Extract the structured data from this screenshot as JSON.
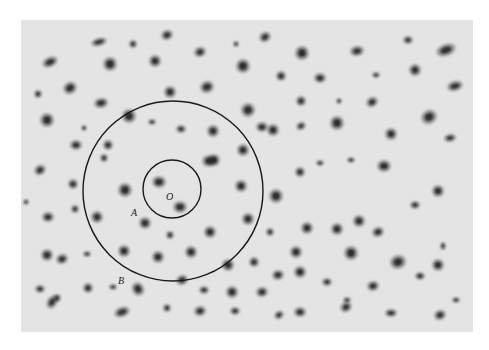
{
  "figure": {
    "background_color": "#e4e4e4",
    "line_color": "#1a1a1a",
    "galaxy_color": "#1c1c1c",
    "labels": [
      {
        "id": "O",
        "text": "O",
        "x": 166,
        "y": 192
      },
      {
        "id": "A",
        "text": "A",
        "x": 131,
        "y": 208
      },
      {
        "id": "B",
        "text": "B",
        "x": 118,
        "y": 276
      }
    ],
    "circles": [
      {
        "name": "inner-circle",
        "cx": 172,
        "cy": 189,
        "r": 29
      },
      {
        "name": "outer-circle",
        "cx": 173,
        "cy": 191,
        "r": 90
      }
    ],
    "galaxies": [
      [
        50,
        62,
        7,
        4,
        -25
      ],
      [
        99,
        42,
        7,
        3,
        -15
      ],
      [
        133,
        44,
        3,
        3,
        0
      ],
      [
        167,
        35,
        5,
        4,
        -20
      ],
      [
        200,
        52,
        5,
        4,
        -20
      ],
      [
        236,
        44,
        2,
        2,
        0
      ],
      [
        265,
        37,
        5,
        4,
        -30
      ],
      [
        302,
        53,
        6,
        6,
        0
      ],
      [
        357,
        51,
        6,
        4,
        -10
      ],
      [
        408,
        40,
        4,
        3,
        0
      ],
      [
        446,
        50,
        9,
        5,
        -20
      ],
      [
        110,
        64,
        6,
        6,
        0
      ],
      [
        155,
        61,
        5,
        5,
        0
      ],
      [
        170,
        92,
        5,
        5,
        0
      ],
      [
        207,
        87,
        5,
        6,
        70
      ],
      [
        243,
        66,
        6,
        6,
        0
      ],
      [
        281,
        76,
        4,
        4,
        0
      ],
      [
        320,
        78,
        5,
        4,
        0
      ],
      [
        376,
        75,
        3,
        2,
        0
      ],
      [
        415,
        70,
        5,
        5,
        60
      ],
      [
        455,
        86,
        7,
        4,
        -15
      ],
      [
        38,
        94,
        3,
        3,
        0
      ],
      [
        70,
        88,
        5,
        6,
        60
      ],
      [
        101,
        103,
        4,
        6,
        80
      ],
      [
        129,
        116,
        6,
        6,
        0
      ],
      [
        152,
        122,
        3,
        2,
        0
      ],
      [
        181,
        129,
        4,
        3,
        0
      ],
      [
        213,
        131,
        5,
        5,
        0
      ],
      [
        248,
        110,
        6,
        6,
        60
      ],
      [
        262,
        127,
        5,
        4,
        0
      ],
      [
        301,
        101,
        4,
        4,
        0
      ],
      [
        339,
        101,
        2,
        2,
        0
      ],
      [
        372,
        102,
        5,
        4,
        -30
      ],
      [
        429,
        117,
        6,
        7,
        60
      ],
      [
        47,
        120,
        6,
        6,
        0
      ],
      [
        84,
        128,
        2,
        2,
        0
      ],
      [
        76,
        145,
        5,
        4,
        0
      ],
      [
        108,
        145,
        4,
        4,
        0
      ],
      [
        214,
        160,
        5,
        5,
        0
      ],
      [
        243,
        150,
        5,
        5,
        0
      ],
      [
        273,
        130,
        5,
        5,
        0
      ],
      [
        301,
        126,
        4,
        3,
        -30
      ],
      [
        337,
        123,
        6,
        6,
        0
      ],
      [
        391,
        134,
        5,
        5,
        0
      ],
      [
        450,
        138,
        3,
        5,
        80
      ],
      [
        40,
        170,
        5,
        4,
        -30
      ],
      [
        73,
        184,
        4,
        4,
        0
      ],
      [
        104,
        158,
        3,
        3,
        0
      ],
      [
        125,
        190,
        6,
        6,
        0
      ],
      [
        159,
        182,
        6,
        5,
        0
      ],
      [
        180,
        207,
        6,
        5,
        0
      ],
      [
        209,
        161,
        6,
        5,
        0
      ],
      [
        241,
        186,
        5,
        5,
        0
      ],
      [
        276,
        196,
        6,
        6,
        0
      ],
      [
        300,
        172,
        4,
        4,
        0
      ],
      [
        320,
        163,
        3,
        2,
        0
      ],
      [
        351,
        160,
        3,
        2,
        0
      ],
      [
        384,
        166,
        6,
        5,
        0
      ],
      [
        438,
        191,
        5,
        5,
        0
      ],
      [
        26,
        202,
        2,
        2,
        0
      ],
      [
        48,
        217,
        5,
        4,
        0
      ],
      [
        75,
        209,
        3,
        3,
        0
      ],
      [
        97,
        217,
        5,
        5,
        60
      ],
      [
        145,
        223,
        5,
        5,
        0
      ],
      [
        170,
        235,
        3,
        3,
        0
      ],
      [
        210,
        232,
        5,
        5,
        0
      ],
      [
        248,
        219,
        5,
        5,
        0
      ],
      [
        270,
        232,
        3,
        3,
        0
      ],
      [
        307,
        228,
        5,
        5,
        0
      ],
      [
        337,
        229,
        5,
        5,
        0
      ],
      [
        359,
        221,
        5,
        5,
        0
      ],
      [
        378,
        232,
        4,
        5,
        70
      ],
      [
        415,
        205,
        4,
        3,
        0
      ],
      [
        443,
        246,
        2,
        3,
        0
      ],
      [
        47,
        255,
        5,
        5,
        0
      ],
      [
        62,
        259,
        5,
        4,
        -20
      ],
      [
        87,
        254,
        3,
        2,
        0
      ],
      [
        124,
        251,
        5,
        5,
        0
      ],
      [
        158,
        257,
        5,
        5,
        0
      ],
      [
        191,
        252,
        5,
        5,
        0
      ],
      [
        228,
        265,
        5,
        5,
        0
      ],
      [
        254,
        262,
        4,
        4,
        0
      ],
      [
        278,
        275,
        4,
        5,
        80
      ],
      [
        296,
        252,
        5,
        5,
        0
      ],
      [
        351,
        253,
        6,
        6,
        0
      ],
      [
        398,
        262,
        6,
        7,
        70
      ],
      [
        438,
        265,
        5,
        5,
        0
      ],
      [
        40,
        289,
        4,
        3,
        0
      ],
      [
        57,
        298,
        3,
        3,
        0
      ],
      [
        88,
        288,
        4,
        4,
        0
      ],
      [
        113,
        287,
        3,
        2,
        0
      ],
      [
        138,
        289,
        6,
        5,
        60
      ],
      [
        182,
        280,
        4,
        5,
        70
      ],
      [
        204,
        290,
        4,
        3,
        0
      ],
      [
        232,
        292,
        5,
        5,
        0
      ],
      [
        262,
        292,
        4,
        5,
        80
      ],
      [
        300,
        272,
        5,
        5,
        0
      ],
      [
        327,
        282,
        4,
        3,
        0
      ],
      [
        347,
        300,
        3,
        2,
        0
      ],
      [
        373,
        286,
        4,
        5,
        80
      ],
      [
        420,
        276,
        4,
        3,
        0
      ],
      [
        52,
        302,
        6,
        4,
        -60
      ],
      [
        122,
        312,
        7,
        4,
        -20
      ],
      [
        167,
        308,
        3,
        3,
        0
      ],
      [
        200,
        311,
        4,
        5,
        80
      ],
      [
        235,
        311,
        4,
        3,
        0
      ],
      [
        279,
        315,
        4,
        3,
        -30
      ],
      [
        300,
        312,
        5,
        4,
        0
      ],
      [
        346,
        307,
        5,
        4,
        -30
      ],
      [
        391,
        313,
        5,
        3,
        0
      ],
      [
        440,
        315,
        5,
        4,
        -20
      ],
      [
        456,
        300,
        3,
        2,
        0
      ]
    ]
  }
}
